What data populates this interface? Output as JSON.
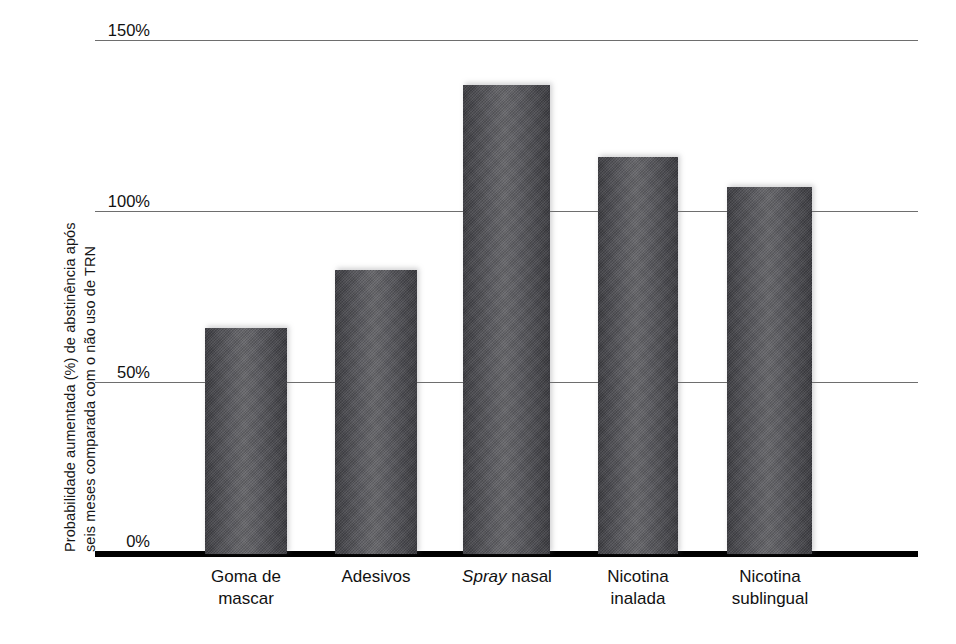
{
  "chart_data": {
    "type": "bar",
    "title": "",
    "subtitle": "",
    "xlabel": "",
    "ylabel": "Probabilidade aumentada (%) de abstinência após seis meses comparada com o não uso de TRN",
    "ylabel_line1": "Probabilidade aumentada (%) de abstinência após",
    "ylabel_line2": "seis meses comparada com o não uso de TRN",
    "categories": [
      "Goma de mascar",
      "Adesivos",
      "Spray nasal",
      "Nicotina inalada",
      "Nicotina sublingual"
    ],
    "values": [
      66,
      83,
      137,
      116,
      107
    ],
    "ylim": [
      0,
      150
    ],
    "yticks": [
      0,
      50,
      100,
      150
    ],
    "ytick_labels": [
      "0%",
      "50%",
      "100%",
      "150%"
    ],
    "grid": true,
    "legend": "none",
    "bar_color": "#55555a",
    "axis_color": "#000000",
    "gridline_color": "#6e6e6e"
  },
  "axis": {
    "y_title_line1": "Probabilidade aumentada (%) de abstinência após",
    "y_title_line2": "seis meses comparada com o não uso de TRN",
    "ticks": [
      {
        "label": "150%",
        "value": 150
      },
      {
        "label": "100%",
        "value": 100
      },
      {
        "label": "50%",
        "value": 50
      },
      {
        "label": "0%",
        "value": 0
      }
    ]
  },
  "bars": [
    {
      "label_line1": "Goma de",
      "label_line2": "mascar",
      "label_italic_part": "",
      "value": 66
    },
    {
      "label_line1": "Adesivos",
      "label_line2": "",
      "label_italic_part": "",
      "value": 83
    },
    {
      "label_line1": "Spray",
      "label_line2": "nasal",
      "label_italic_part": "Spray",
      "value": 137
    },
    {
      "label_line1": "Nicotina",
      "label_line2": "inalada",
      "label_italic_part": "",
      "value": 116
    },
    {
      "label_line1": "Nicotina",
      "label_line2": "sublingual",
      "label_italic_part": "",
      "value": 107
    }
  ]
}
